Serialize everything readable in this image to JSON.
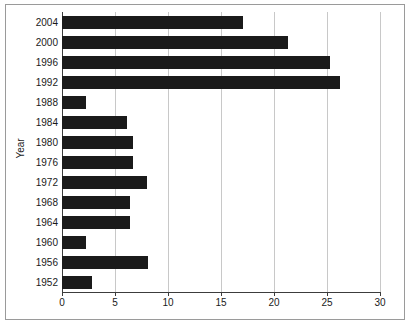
{
  "chart_data": {
    "type": "bar",
    "orientation": "horizontal",
    "title": "",
    "xlabel": "",
    "ylabel": "Year",
    "categories": [
      "2004",
      "2000",
      "1996",
      "1992",
      "1988",
      "1984",
      "1980",
      "1976",
      "1972",
      "1968",
      "1964",
      "1960",
      "1956",
      "1952"
    ],
    "values": [
      17.1,
      21.3,
      25.3,
      26.2,
      2.3,
      6.1,
      6.7,
      6.7,
      8.0,
      6.4,
      6.4,
      2.3,
      8.1,
      2.8
    ],
    "xticks": [
      "0",
      "5",
      "10",
      "15",
      "20",
      "25",
      "30"
    ],
    "xtick_values": [
      0,
      5,
      10,
      15,
      20,
      25,
      30
    ],
    "xlim": [
      0,
      30
    ],
    "grid": "vertical",
    "legend": "none",
    "bar_color": "#1a1a1a",
    "grid_color": "#c8c8c8",
    "axis_color": "#3c3c3c",
    "background": "#ffffff"
  }
}
